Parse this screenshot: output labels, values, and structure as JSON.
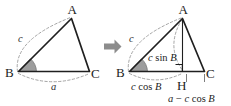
{
  "figure": {
    "transform_arrow": "arrow-right",
    "colors": {
      "stroke": "#1f1f1f",
      "dashed": "#9a9a9a",
      "angle_fill": "#9d9d9d",
      "arrow": "#8c8c8c",
      "background": "#ffffff"
    }
  },
  "left_figure": {
    "name": "original-triangle",
    "vertices": {
      "A": "A",
      "B": "B",
      "C": "C"
    },
    "side_labels": {
      "c": "c",
      "a": "a"
    }
  },
  "right_figure": {
    "name": "triangle-with-altitude",
    "vertices": {
      "A": "A",
      "B": "B",
      "C": "C",
      "H": "H"
    },
    "side_labels": {
      "c": "c"
    },
    "expressions": {
      "altitude": {
        "var1": "c",
        "func": " sin ",
        "var2": "B"
      },
      "adjacent": {
        "var1": "c",
        "func": " cos ",
        "var2": "B"
      },
      "remainder": {
        "var1": "a",
        "op": " − ",
        "var2": "c",
        "func": " cos ",
        "var3": "B"
      }
    }
  }
}
